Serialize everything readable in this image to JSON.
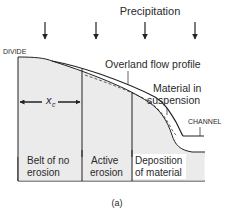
{
  "figure": {
    "title": "Precipitation",
    "labels": {
      "divide": "DIVIDE",
      "channel": "CHANNEL",
      "overland_flow": "Overland flow profile",
      "material_line1": "Material in",
      "material_line2": "suspension",
      "xc_main": "x",
      "xc_sub": "c",
      "caption": "(a)"
    },
    "zones": [
      {
        "line1": "Belt of no",
        "line2": "erosion"
      },
      {
        "line1": "Active",
        "line2": "erosion"
      },
      {
        "line1": "Deposition",
        "line2": "of material"
      }
    ],
    "colors": {
      "ground_fill": "#ebebeb",
      "stroke": "#222222"
    }
  }
}
